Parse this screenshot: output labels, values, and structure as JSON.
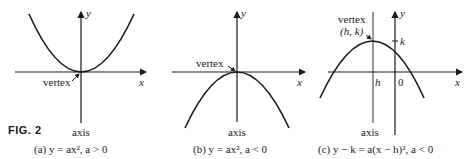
{
  "figure_label": "FIG. 2",
  "panels": [
    {
      "id": "a",
      "caption": "(a)   y = ax²,    a > 0",
      "labels": {
        "y_axis": "y",
        "x_axis": "x",
        "vertex": "vertex",
        "axis": "axis"
      },
      "opens": "up"
    },
    {
      "id": "b",
      "caption": "(b)   y = ax²,    a < 0",
      "labels": {
        "y_axis": "y",
        "x_axis": "x",
        "vertex": "vertex",
        "axis": "axis"
      },
      "opens": "down"
    },
    {
      "id": "c",
      "caption": "(c)   y − k = a(x − h)²,    a < 0",
      "labels": {
        "y_axis": "y",
        "x_axis": "x",
        "vertex": "vertex",
        "vertex_coords": "(h, k)",
        "axis": "axis",
        "h_tick": "h",
        "zero_tick": "0",
        "k_tick": "k"
      },
      "opens": "down"
    }
  ],
  "colors": {
    "ink": "#1a1a1a",
    "background": "#ffffff"
  }
}
